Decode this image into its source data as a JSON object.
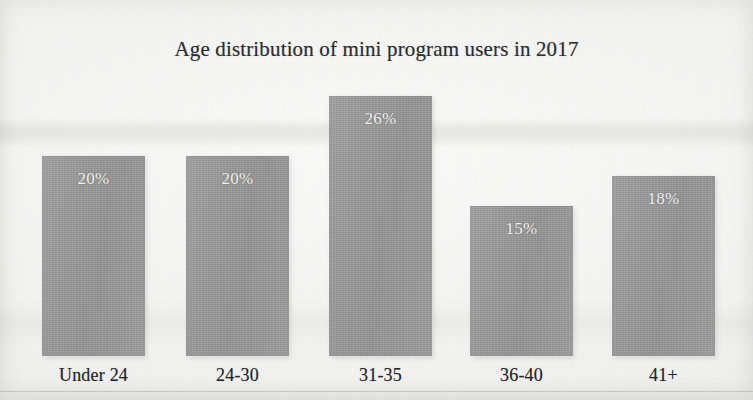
{
  "chart_data": {
    "type": "bar",
    "title": "Age distribution of mini program users in 2017",
    "xlabel": "",
    "ylabel": "",
    "categories": [
      "Under 24",
      "24-30",
      "31-35",
      "36-40",
      "41+"
    ],
    "values": [
      20,
      20,
      26,
      15,
      18
    ],
    "value_labels": [
      "20%",
      "20%",
      "26%",
      "15%",
      "18%"
    ],
    "value_unit": "%",
    "ylim": [
      0,
      26
    ],
    "grid": false,
    "legend": null,
    "axes_visible": false,
    "bar_color": "#9b9b9b",
    "value_label_color": "#f2f2f0",
    "category_label_color": "#262626",
    "title_color": "#2e2e2e",
    "background_color": "#f7f7f5"
  },
  "figure": {
    "title": "Age distribution of mini program users in 2017"
  }
}
